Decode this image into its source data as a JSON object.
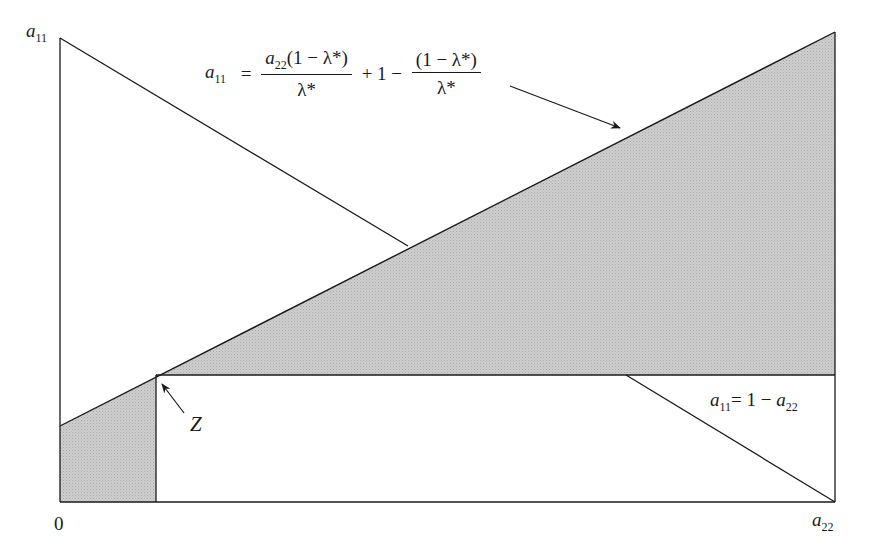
{
  "diagram": {
    "type": "region-plot",
    "axes": {
      "y_label": {
        "var": "a",
        "sub": "11"
      },
      "x_label": {
        "var": "a",
        "sub": "22"
      },
      "origin_label": "0"
    },
    "curves": {
      "rising_line": {
        "lhs_var": "a",
        "lhs_sub": "11",
        "eq": "=",
        "frac1_num_var": "a",
        "frac1_num_sub": "22",
        "frac1_num_rest": "(1 − λ*)",
        "frac1_den": "λ*",
        "mid": "+ 1 −",
        "frac2_num": "(1 − λ*)",
        "frac2_den": "λ*"
      },
      "descending_line": {
        "lhs_var": "a",
        "lhs_sub": "11",
        "rhs": "= 1 − ",
        "rhs_var": "a",
        "rhs_sub": "22"
      }
    },
    "point_label": "Z",
    "colors": {
      "shade": "#c4c4c4",
      "line": "#1a1a1a",
      "background": "#ffffff"
    }
  }
}
